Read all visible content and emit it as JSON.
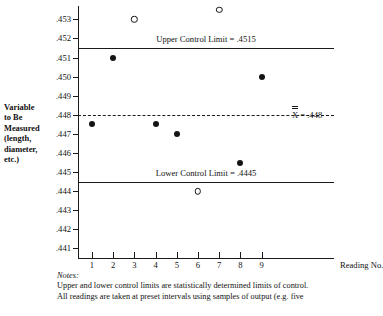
{
  "axis_label": {
    "lines": [
      "Variable",
      "to Be",
      "Measured",
      "(length,",
      "diameter,",
      "etc.)"
    ]
  },
  "x_axis_title": "Reading No.",
  "limits": {
    "ucl_label": "Upper Control Limit = .4515",
    "lcl_label": "Lower Control Limit = .4445",
    "mean_label_x": "X",
    "mean_label_eq": "= .448"
  },
  "notes": {
    "heading": "Notes:",
    "line1": "Upper and lower control limits are statistically determined limits of control.",
    "line2": "All readings are taken at preset intervals using samples of output (e.g. five"
  },
  "colors": {
    "ink": "#1a1a1a",
    "background": "#ffffff",
    "marker_in_control": "#141414",
    "marker_out_of_control": "#ffffff"
  },
  "chart_data": {
    "type": "scatter",
    "title": "",
    "xlabel": "Reading No.",
    "ylabel": "Variable to Be Measured (length, diameter, etc.)",
    "x": [
      1,
      2,
      3,
      4,
      5,
      6,
      7,
      8,
      9
    ],
    "values": [
      0.4475,
      0.451,
      0.453,
      0.4475,
      0.447,
      0.444,
      0.4535,
      0.4455,
      0.45
    ],
    "point_states": [
      "in-control",
      "in-control",
      "out-of-control",
      "in-control",
      "in-control",
      "out-of-control",
      "out-of-control",
      "in-control",
      "in-control"
    ],
    "ytick_labels": [
      ".453",
      ".452",
      ".451",
      ".450",
      ".449",
      ".448",
      ".447",
      ".446",
      ".445",
      ".444",
      ".443",
      ".442",
      ".441"
    ],
    "ytick_values": [
      0.453,
      0.452,
      0.451,
      0.45,
      0.449,
      0.448,
      0.447,
      0.446,
      0.445,
      0.444,
      0.443,
      0.442,
      0.441
    ],
    "xtick_labels": [
      "1",
      "2",
      "3",
      "4",
      "5",
      "6",
      "7",
      "8",
      "9"
    ],
    "ylim": [
      0.4405,
      0.4537
    ],
    "upper_control_limit": 0.4515,
    "lower_control_limit": 0.4445,
    "center_line_mean": 0.448,
    "grid": false,
    "legend": "none"
  }
}
